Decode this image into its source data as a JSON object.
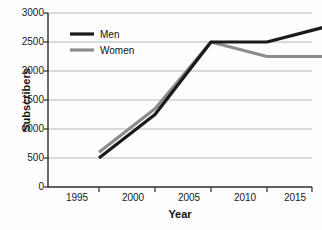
{
  "chart_data": {
    "type": "line",
    "title": "",
    "xlabel": "Year",
    "ylabel": "Subscribers",
    "categories": [
      "1995",
      "2000",
      "2005",
      "2010",
      "2015"
    ],
    "x": [
      1995,
      2000,
      2005,
      2010,
      2015
    ],
    "xlim": [
      1993,
      2017
    ],
    "ylim": [
      0,
      3000
    ],
    "yticks": [
      "3000",
      "2500",
      "2000",
      "1500",
      "1000",
      "500",
      "0"
    ],
    "ytick_values": [
      3000,
      2500,
      2000,
      1500,
      1000,
      500,
      0
    ],
    "grid": "horizontal",
    "legend_position": "upper-left-inside",
    "series": [
      {
        "name": "Men",
        "color": "#1a1a1a",
        "values": [
          500,
          1250,
          2500,
          2500,
          2750
        ]
      },
      {
        "name": "Women",
        "color": "#8c8c8c",
        "values": [
          600,
          1350,
          2500,
          2250,
          2250
        ]
      }
    ]
  },
  "legend": {
    "entries": [
      {
        "label": "Men",
        "color": "#1a1a1a"
      },
      {
        "label": "Women",
        "color": "#8c8c8c"
      }
    ]
  },
  "colors": {
    "men": "#1a1a1a",
    "women": "#8c8c8c",
    "axis": "#2b2b2b",
    "grid": "#b8b8b8",
    "background": "#fdfdfd"
  }
}
